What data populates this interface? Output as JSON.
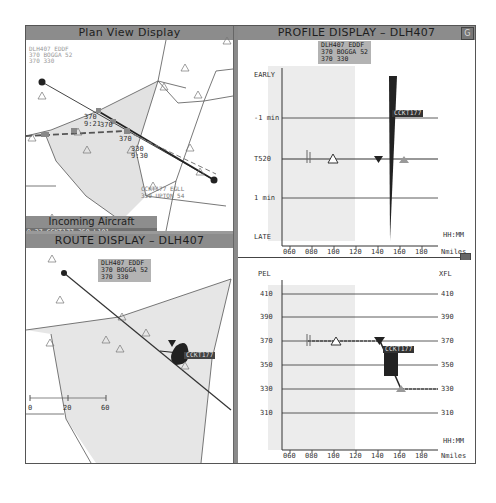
{
  "plan_view": {
    "title": "Plan View Display",
    "top_label": [
      "DLH407 EDDF",
      "370 BOGGA 52",
      "370 330"
    ],
    "track_labels": [
      "370",
      "9:21",
      "370",
      "370",
      "330",
      "9:30"
    ],
    "bottom_label": [
      "CCKT177 EGLL",
      "350 UPTON 54"
    ]
  },
  "incoming": {
    "title": "Incoming Aircraft",
    "rows": [
      {
        "time": "9:27",
        "callsign": "CCKT177",
        "level": "350",
        "fix": "L101"
      },
      {
        "time": "9:31",
        "callsign": "DLH407",
        "level": "370",
        "fix": "EA31"
      }
    ]
  },
  "route_display": {
    "title": "ROUTE DISPLAY – DLH407",
    "label": [
      "DLH407 EDDF",
      "370 BOGGA 52",
      "370 330"
    ],
    "conflict_tag": "CCKT177",
    "scale": [
      "0",
      "20",
      "60"
    ]
  },
  "profile_display": {
    "title": "PROFILE DISPLAY – DLH407",
    "corner_button": "G",
    "label": [
      "DLH407 EDDF",
      "370 BOGGA 52",
      "370 330"
    ],
    "y_labels": [
      "EARLY",
      "-1 min",
      "T520",
      "1 min",
      "LATE"
    ],
    "x_ticks": [
      "060",
      "080",
      "100",
      "120",
      "140",
      "160",
      "180"
    ],
    "x_unit_top": "HH:MM",
    "x_unit": "Nmiles",
    "conflict_tag": "CCKT177"
  },
  "vertical_display": {
    "left_title": "PEL",
    "right_title": "XFL",
    "levels": [
      "410",
      "390",
      "370",
      "350",
      "330",
      "310"
    ],
    "x_ticks": [
      "060",
      "080",
      "100",
      "120",
      "140",
      "160",
      "180"
    ],
    "x_unit_top": "HH:MM",
    "x_unit": "Nmiles",
    "conflict_tag": "CCKT177"
  }
}
